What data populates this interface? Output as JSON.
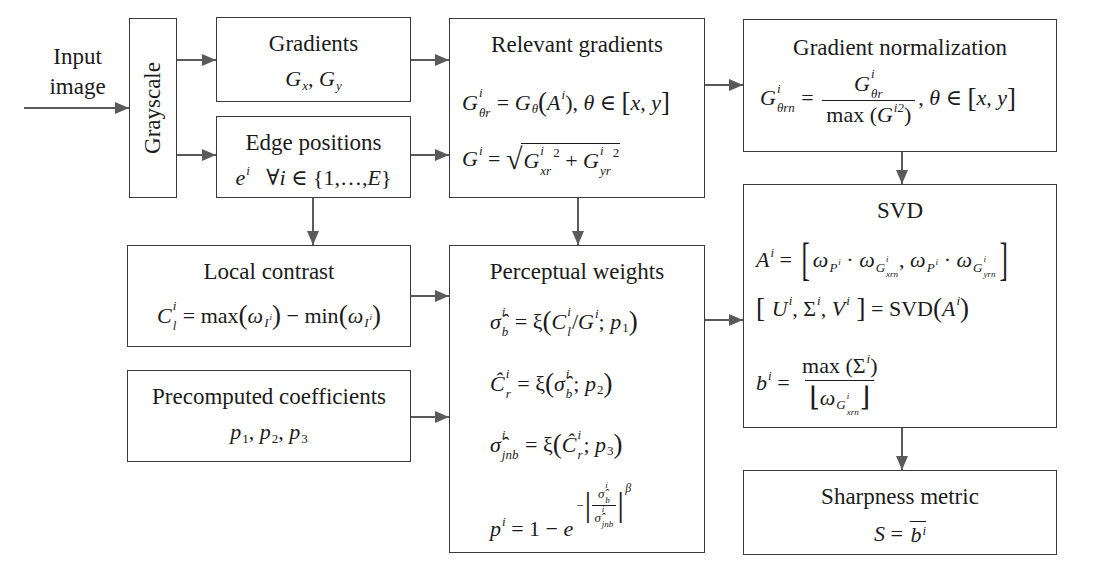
{
  "input": {
    "line1": "Input",
    "line2": "image"
  },
  "grayscale": {
    "label": "Grayscale"
  },
  "gradients": {
    "title": "Gradients",
    "g1": "G",
    "s1": "x",
    "sep": ", ",
    "g2": "G",
    "s2": "y"
  },
  "edge": {
    "title": "Edge positions",
    "e": "e",
    "e_sup": "i",
    "forall": "   ∀",
    "i": "i",
    "set": " ∈ {1,…,",
    "E": "E",
    "close": "}"
  },
  "relevant": {
    "title": "Relevant gradients",
    "eq1": {
      "G": "G",
      "sup": "i",
      "sub": "θr",
      "eq": " = ",
      "G2": "G",
      "sub2": "θ",
      "open": "(",
      "A": "A",
      "supA": "i",
      "close": "), ",
      "theta": "θ",
      "in": " ∈ ",
      "lb": "[",
      "xy": "x, y",
      "rb": "]"
    },
    "eq2": {
      "G": "G",
      "sup": "i",
      "eq": " = ",
      "root": "√",
      "Gx": "G",
      "supx": "i",
      "subx": "xr",
      "pow1": "2",
      "plus": " + ",
      "Gy": "G",
      "supy": "i",
      "suby": "yr",
      "pow2": "2"
    }
  },
  "grad_norm": {
    "title": "Gradient normalization",
    "G": "G",
    "sup": "i",
    "sub": "θrn",
    "eq": " = ",
    "num_G": "G",
    "num_sup": "i",
    "num_sub": "θr",
    "den_max": "max (",
    "den_G": "G",
    "den_sup": "i2",
    "den_close": ")",
    "tail": ", ",
    "theta": "θ",
    "in": " ∈ ",
    "lb": "[",
    "xy": "x, y",
    "rb": "]"
  },
  "svd": {
    "title": "SVD",
    "eq1": {
      "A": "A",
      "sup": "i",
      "eq": " = ",
      "lb": "[",
      "w1": "ω",
      "p1": "P",
      "p1sup": "i",
      "dot1": " · ",
      "w2": "ω",
      "g1": "G",
      "g1sup": "i",
      "g1sub": "xrn",
      "comma": ", ",
      "w3": "ω",
      "p2": "P",
      "p2sup": "i",
      "dot2": " · ",
      "w4": "ω",
      "g2": "G",
      "g2sup": "i",
      "g2sub": "yrn",
      "rb": "]"
    },
    "eq2": {
      "lb": "[ ",
      "U": "U",
      "Usup": "i",
      "c1": ", ",
      "S": "Σ",
      "Ssup": "i",
      "c2": ", ",
      "V": "V",
      "Vsup": "i",
      "rb": " ]",
      "eq": " = SVD",
      "open": "(",
      "A": "A",
      "Asup": "i",
      "close": ")"
    },
    "eq3": {
      "b": "b",
      "bsup": "i",
      "eq": " = ",
      "num": "max (Σ",
      "numsup": "i",
      "numclose": ")",
      "lf": "⌊",
      "w": "ω",
      "g": "G",
      "gsup": "i",
      "gsub": "xrn",
      "rf": "⌋"
    }
  },
  "sharpness": {
    "title": "Sharpness metric",
    "S": "S",
    "eq": " = ",
    "b": "b",
    "bsup": "i"
  },
  "local": {
    "title": "Local contrast",
    "C": "C",
    "sup": "i",
    "sub": "l",
    "eq": " = max",
    "o1": "(",
    "w1": "ω",
    "I1": "I",
    "I1sup": "i",
    "c1": ")",
    "minus": " − min",
    "o2": "(",
    "w2": "ω",
    "I2": "I",
    "I2sup": "i",
    "c2": ")"
  },
  "precomputed": {
    "title": "Precomputed coefficients",
    "p1": "p",
    "s1": "1",
    "c1": ", ",
    "p2": "p",
    "s2": "2",
    "c2": ", ",
    "p3": "p",
    "s3": "3"
  },
  "perceptual": {
    "title": "Perceptual weights",
    "eq1": {
      "sig": "σ̂",
      "sup": "i",
      "sub": "b",
      "eq": " = ξ",
      "open": "(",
      "C": "C",
      "Csup": "i",
      "Csub": "l",
      "slash": "/",
      "G": "G",
      "Gsup": "i",
      "semi": "; ",
      "p": "p",
      "psub": "1",
      "close": ")"
    },
    "eq2": {
      "C": "Ĉ",
      "sup": "i",
      "sub": "r",
      "eq": " = ξ",
      "open": "(",
      "sig": "σ̂",
      "sigsup": "i",
      "sigsub": "b",
      "semi": "; ",
      "p": "p",
      "psub": "2",
      "close": ")"
    },
    "eq3": {
      "sig": "σ̂",
      "sup": "i",
      "sub": "jnb",
      "eq": " = ξ",
      "open": "(",
      "C": "Ĉ",
      "Csup": "i",
      "Csub": "r",
      "semi": "; ",
      "p": "p",
      "psub": "3",
      "close": ")"
    },
    "eq4": {
      "p": "p",
      "sup": "i",
      "eq": " = 1 − ",
      "e": "e",
      "neg": "−",
      "bar1": "|",
      "num": "σ̂",
      "numsup": "i",
      "numsub": "b",
      "den": "σ̂",
      "densup": "i",
      "densub": "jnb",
      "bar2": "|",
      "beta": "β"
    }
  },
  "colors": {
    "box_border": "#3a3a3a",
    "arrow": "#5a5a5a",
    "text": "#1b1b1b",
    "background": "#ffffff"
  }
}
